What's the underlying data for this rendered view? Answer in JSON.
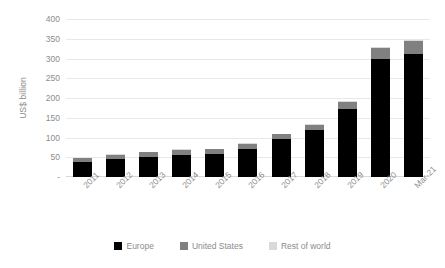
{
  "chart_data": {
    "type": "bar",
    "subtype": "stacked-column",
    "title": "",
    "subtitle": "",
    "xlabel": "",
    "ylabel": "US$ billion",
    "categories": [
      "2011",
      "2012",
      "2013",
      "2014",
      "2015",
      "2016",
      "2017",
      "2018",
      "2019",
      "2020",
      "Mar-21"
    ],
    "series": [
      {
        "name": "Europe",
        "color": "#000000",
        "values": [
          38,
          46,
          51,
          56,
          58,
          70,
          95,
          120,
          172,
          300,
          312
        ]
      },
      {
        "name": "United States",
        "color": "#808080",
        "values": [
          9,
          11,
          12,
          13,
          13,
          14,
          14,
          12,
          18,
          27,
          33
        ]
      },
      {
        "name": "Rest of world",
        "color": "#D9D9D9",
        "values": [
          1,
          1,
          1,
          1,
          1,
          1,
          1,
          1,
          3,
          3,
          3
        ]
      }
    ],
    "totals": [
      48,
      58,
      64,
      70,
      72,
      85,
      110,
      133,
      193,
      330,
      348
    ],
    "ylim": [
      0,
      400
    ],
    "yticks": [
      0,
      50,
      100,
      150,
      200,
      250,
      300,
      350,
      400
    ],
    "ytick_labels": [
      "-",
      "50",
      "100",
      "150",
      "200",
      "250",
      "300",
      "350",
      "400"
    ],
    "grid": true,
    "grid_axis": "y",
    "legend_position": "bottom",
    "axis_label_rotation": -45
  },
  "legend": {
    "items": [
      {
        "label": "Europe",
        "color": "#000000"
      },
      {
        "label": "United States",
        "color": "#808080"
      },
      {
        "label": "Rest of world",
        "color": "#D9D9D9"
      }
    ]
  },
  "colors": {
    "gridline": "#E8E8E8",
    "axis": "#D9D9D9",
    "text": "#8C8C8C",
    "background": "#FFFFFF"
  }
}
